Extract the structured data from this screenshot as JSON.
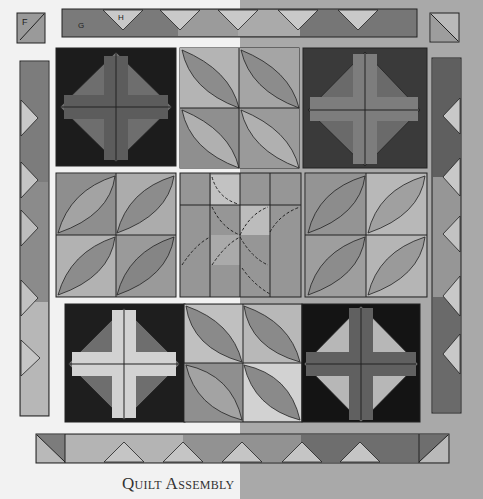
{
  "caption": "Quilt Assembly",
  "labels": {
    "corner_top_left": "F",
    "top_border_a": "G",
    "top_border_b": "H"
  },
  "colors": {
    "background_left": "#f2f2f2",
    "background_right": "#a9a9a9",
    "black": "#1a1a1a",
    "dark_gray": "#555555",
    "medium_gray": "#7d7d7d",
    "light_gray": "#b4b4b4",
    "pale_gray": "#cfcfcf",
    "line": "#1e1e1e"
  },
  "layout": {
    "grid_rows": 3,
    "grid_cols": 3,
    "blocks": [
      [
        "cross-diamond-dark",
        "leaf-2x2-down",
        "cross-diamond-dark"
      ],
      [
        "leaf-2x2-up",
        "star-leaf-4x4",
        "leaf-2x2-up"
      ],
      [
        "cross-diamond-light",
        "leaf-2x2-down",
        "cross-diamond-light"
      ]
    ],
    "borders": [
      "top",
      "bottom",
      "left",
      "right"
    ],
    "corner_squares": [
      "top-left",
      "top-right",
      "bottom-left",
      "bottom-right"
    ]
  }
}
